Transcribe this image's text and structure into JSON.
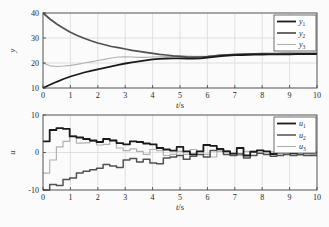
{
  "figure": {
    "background": "#fbfbfb",
    "axis_color": "#3f3f3f",
    "grid_color": "#d9d9d9",
    "text_color": "#1f1f1f",
    "legend_bg": "#ffffff",
    "legend_border": "#4a4a4a"
  },
  "chart_data": [
    {
      "id": "output-chart",
      "type": "line",
      "title": "",
      "xlabel_var": "t",
      "xlabel_unit": "s",
      "ylabel": "y",
      "xlim": [
        0,
        10
      ],
      "ylim": [
        10,
        40
      ],
      "xticks": [
        0,
        1,
        2,
        3,
        4,
        5,
        6,
        7,
        8,
        9,
        10
      ],
      "yticks": [
        10,
        20,
        30,
        40
      ],
      "grid_x": [
        1,
        2,
        3,
        4,
        5,
        6,
        7,
        8,
        9
      ],
      "grid_y": [
        20,
        30
      ],
      "legend_position": "top-right",
      "series": [
        {
          "label_base": "y",
          "label_sub": "1",
          "color": "#1b1b1b",
          "line_width": 1.8,
          "values": [
            10.0,
            11.3,
            12.5,
            13.6,
            14.6,
            15.4,
            16.2,
            16.9,
            17.5,
            18.1,
            18.7,
            19.3,
            19.8,
            20.3,
            20.7,
            21.1,
            21.5,
            21.7,
            21.8,
            21.9,
            21.9,
            21.8,
            21.8,
            21.9,
            22.2,
            22.5,
            22.8,
            23.0,
            23.1,
            23.2,
            23.3,
            23.4,
            23.4,
            23.5,
            23.5,
            23.5,
            23.5,
            23.6,
            23.6,
            23.6,
            23.6
          ]
        },
        {
          "label_base": "y",
          "label_sub": "2",
          "color": "#515151",
          "line_width": 1.7,
          "values": [
            40.0,
            37.6,
            35.6,
            33.9,
            32.3,
            31.0,
            29.9,
            28.9,
            28.0,
            27.3,
            26.6,
            26.1,
            25.6,
            25.1,
            24.7,
            24.3,
            23.9,
            23.5,
            23.2,
            22.9,
            22.7,
            22.5,
            22.4,
            22.4,
            22.6,
            22.9,
            23.1,
            23.3,
            23.5,
            23.6,
            23.7,
            23.7,
            23.8,
            23.8,
            23.8,
            23.9,
            23.9,
            23.9,
            23.9,
            23.9,
            23.9
          ]
        },
        {
          "label_base": "y",
          "label_sub": "3",
          "color": "#b2b2b2",
          "line_width": 1.2,
          "values": [
            20.0,
            18.9,
            18.6,
            18.8,
            19.1,
            19.5,
            20.0,
            20.5,
            21.0,
            21.5,
            22.0,
            22.4,
            22.5,
            22.4,
            22.3,
            22.3,
            22.4,
            22.5,
            22.6,
            22.7,
            22.8,
            22.8,
            22.7,
            22.7,
            22.8,
            23.0,
            23.2,
            23.3,
            23.4,
            23.5,
            23.5,
            23.6,
            23.6,
            23.6,
            23.7,
            23.7,
            23.7,
            23.7,
            23.7,
            23.7,
            23.7
          ]
        }
      ]
    },
    {
      "id": "control-chart",
      "type": "step",
      "title": "",
      "xlabel_var": "t",
      "xlabel_unit": "s",
      "ylabel": "u",
      "xlim": [
        0,
        10
      ],
      "ylim": [
        -10,
        10
      ],
      "xticks": [
        0,
        1,
        2,
        3,
        4,
        5,
        6,
        7,
        8,
        9,
        10
      ],
      "yticks": [
        -10,
        0,
        10
      ],
      "grid_x": [
        1,
        2,
        3,
        4,
        5,
        6,
        7,
        8,
        9
      ],
      "grid_y": [
        0
      ],
      "legend_position": "top-right",
      "series": [
        {
          "label_base": "u",
          "label_sub": "1",
          "color": "#1b1b1b",
          "line_width": 1.8,
          "values": [
            3.0,
            6.0,
            6.5,
            6.3,
            4.3,
            4.0,
            3.6,
            3.2,
            2.8,
            3.6,
            3.2,
            2.5,
            2.2,
            3.0,
            2.8,
            2.4,
            2.2,
            1.2,
            0.8,
            0.5,
            1.5,
            0.3,
            -0.5,
            0.3,
            2.0,
            1.8,
            1.0,
            0.3,
            -0.3,
            1.2,
            -0.8,
            0.2,
            0.6,
            0.3,
            -0.4,
            0.2,
            0.4,
            -0.2,
            0.2,
            0.0,
            0.0
          ]
        },
        {
          "label_base": "u",
          "label_sub": "2",
          "color": "#515151",
          "line_width": 1.5,
          "values": [
            -10.0,
            -8.5,
            -8.8,
            -7.2,
            -6.8,
            -5.5,
            -5.0,
            -4.6,
            -4.2,
            -3.2,
            -3.6,
            -4.0,
            -2.0,
            -1.6,
            -2.5,
            -1.8,
            -2.8,
            -3.0,
            -1.5,
            -1.2,
            -0.8,
            -1.8,
            -1.0,
            -0.5,
            -1.2,
            0.5,
            0.8,
            -0.5,
            -0.8,
            -0.4,
            -1.5,
            -0.8,
            -0.2,
            -0.5,
            -1.0,
            -0.8,
            -0.5,
            -0.8,
            -0.6,
            -0.8,
            -0.8
          ]
        },
        {
          "label_base": "u",
          "label_sub": "3",
          "color": "#b2b2b2",
          "line_width": 1.2,
          "values": [
            -5.5,
            -2.0,
            1.5,
            3.0,
            4.5,
            2.5,
            2.6,
            3.0,
            2.0,
            2.2,
            3.3,
            1.2,
            0.5,
            1.0,
            0.3,
            -0.5,
            0.8,
            0.5,
            -0.8,
            -0.5,
            0.3,
            -0.5,
            0.8,
            0.3,
            -0.5,
            -1.2,
            0.3,
            0.5,
            -0.3,
            -0.8,
            0.3,
            0.5,
            -0.3,
            -0.5,
            0.2,
            -0.3,
            -0.4,
            -0.2,
            -0.3,
            -0.4,
            -0.5
          ]
        }
      ]
    }
  ]
}
